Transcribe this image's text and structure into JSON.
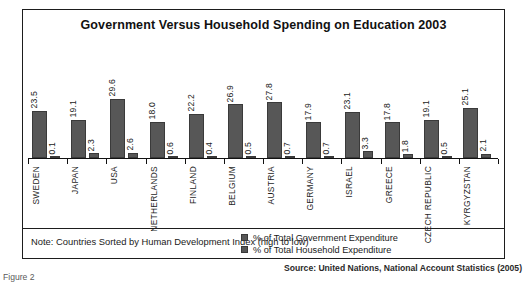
{
  "figure": {
    "caption": "Figure 2",
    "source": "Source: United Nations, National Account Statistics (2005)"
  },
  "chart": {
    "title": "Government Versus Household Spending on Education 2003",
    "note": "Note: Countries Sorted by Human Development Index (high to low)",
    "legend": [
      {
        "label": "% of Total Government Expenditure",
        "color": "#575757"
      },
      {
        "label": "% of Total Household Expenditure",
        "color": "#575757"
      }
    ]
  },
  "chart_data": {
    "type": "bar",
    "title": "Government Versus Household Spending on Education 2003",
    "xlabel": "",
    "ylabel": "",
    "ylim": [
      0,
      30
    ],
    "grid": false,
    "legend_position": "bottom-right",
    "annotations": [
      "Note: Countries Sorted by Human Development Index (high to low)",
      "Source: United Nations, National Account Statistics (2005)"
    ],
    "categories": [
      "SWEDEN",
      "JAPAN",
      "USA",
      "NETHERLANDS",
      "FINLAND",
      "BELGIUM",
      "AUSTRIA",
      "GERMANY",
      "ISRAEL",
      "GREECE",
      "CZECH REPUBLIC",
      "KYRGYZSTAN"
    ],
    "series": [
      {
        "name": "% of Total Government Expenditure",
        "values": [
          23.5,
          19.1,
          29.6,
          18.0,
          22.2,
          26.9,
          27.8,
          17.9,
          23.1,
          17.8,
          19.1,
          25.1
        ]
      },
      {
        "name": "% of Total Household Expenditure",
        "values": [
          0.1,
          2.3,
          2.6,
          0.6,
          0.4,
          0.5,
          0.7,
          0.7,
          3.3,
          1.8,
          0.5,
          2.1
        ]
      }
    ]
  }
}
